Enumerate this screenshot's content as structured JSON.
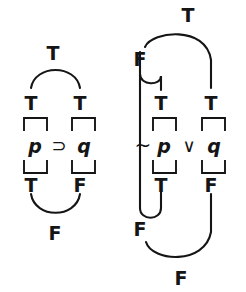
{
  "figure": {
    "background_color": "#ffffff",
    "ink_color": "#151515",
    "width": 246,
    "height": 292
  },
  "formulas": [
    {
      "id": "conditional",
      "expression": "p ⊃ q",
      "connective_symbol": "⊃",
      "connective_name": "horseshoe-conditional",
      "negation_symbol": "",
      "left_variable": "p",
      "right_variable": "q",
      "top_row_values": [
        "T",
        "T"
      ],
      "bottom_row_values": [
        "T",
        "F"
      ],
      "top_result_value": "T",
      "bottom_result_value": "F"
    },
    {
      "id": "disjunction",
      "expression": "~p ∨ q",
      "connective_symbol": "∨",
      "connective_name": "wedge-disjunction",
      "negation_symbol": "~",
      "left_variable": "p",
      "right_variable": "q",
      "top_row_values": [
        "T",
        "T"
      ],
      "bottom_row_values": [
        "T",
        "F"
      ],
      "top_negation_value": "F",
      "bottom_negation_value": "F",
      "top_result_value": "T",
      "bottom_result_value": "F"
    }
  ],
  "labels": {
    "left": {
      "top_result": "T",
      "top_p": "T",
      "top_q": "T",
      "var_p": "p",
      "connective": "⊃",
      "var_q": "q",
      "bottom_p": "T",
      "bottom_q": "F",
      "bottom_result": "F"
    },
    "right": {
      "top_result": "T",
      "top_neg": "F",
      "top_p": "T",
      "top_q": "T",
      "negation": "~",
      "var_p": "p",
      "connective": "∨",
      "var_q": "q",
      "bottom_p": "T",
      "bottom_q": "F",
      "bottom_neg": "F",
      "bottom_result": "F"
    }
  }
}
